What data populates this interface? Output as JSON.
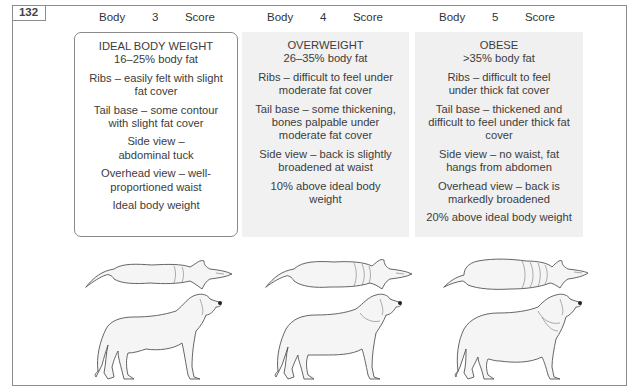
{
  "figure": {
    "number": "132"
  },
  "columns": [
    {
      "header": {
        "word1": "Body",
        "score": "3",
        "word2": "Score"
      },
      "category": "IDEAL BODY WEIGHT",
      "body_fat": "16–25% body fat",
      "criteria": [
        "Ribs – easily felt with slight fat cover",
        "Tail base – some contour with slight fat cover",
        "Side view – abdominal tuck",
        "Overhead view – well-proportioned waist",
        "Ideal body weight"
      ],
      "box_style": "outlined-white",
      "illustrations": [
        "overhead-view-dog",
        "side-view-dog"
      ]
    },
    {
      "header": {
        "word1": "Body",
        "score": "4",
        "word2": "Score"
      },
      "category": "OVERWEIGHT",
      "body_fat": "26–35% body fat",
      "criteria": [
        "Ribs – difficult to feel under moderate fat cover",
        "Tail base – some thickening, bones palpable under moderate fat cover",
        "Side view – back is slightly broadened at waist",
        "10% above ideal body weight"
      ],
      "box_style": "shaded-gray",
      "illustrations": [
        "overhead-view-dog",
        "side-view-dog"
      ]
    },
    {
      "header": {
        "word1": "Body",
        "score": "5",
        "word2": "Score"
      },
      "category": "OBESE",
      "body_fat": ">35% body fat",
      "criteria": [
        "Ribs – difficult to feel under thick fat cover",
        "Tail base – thickened and difficult to feel under thick fat cover",
        "Side view – no waist, fat hangs from abdomen",
        "Overhead view – back is markedly broadened",
        "20% above ideal body weight"
      ],
      "box_style": "shaded-gray",
      "illustrations": [
        "overhead-view-dog",
        "side-view-dog"
      ]
    }
  ],
  "colors": {
    "border": "#8c8c8c",
    "text": "#3a3a3a",
    "shaded_box": "#f1f1f1",
    "dog_fill": "#f5f5f5",
    "dog_outline": "#555555"
  }
}
